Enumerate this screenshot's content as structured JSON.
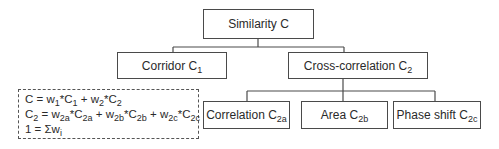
{
  "diagram": {
    "root": {
      "label": "Similarity C"
    },
    "level1": [
      {
        "label": "Corridor C",
        "sub": "1"
      },
      {
        "label": "Cross-correlation C",
        "sub": "2"
      }
    ],
    "level2": [
      {
        "label": "Correlation C",
        "sub": "2a"
      },
      {
        "label": "Area C",
        "sub": "2b"
      },
      {
        "label": "Phase shift C",
        "sub": "2c"
      }
    ],
    "formula": {
      "line1": {
        "a": "C = w",
        "s1": "1",
        "b": "*C",
        "s2": "1",
        "c": " + w",
        "s3": "2",
        "d": "*C",
        "s4": "2"
      },
      "line2": {
        "a": "C",
        "s1": "2",
        "b": " = w",
        "s2": "2a",
        "c": "*C",
        "s3": "2a",
        "d": " + w",
        "s4": "2b",
        "e": "*C",
        "s5": "2b",
        "f": " + w",
        "s6": "2c",
        "g": "*C",
        "s7": "2c"
      },
      "line3": {
        "a": "1 = Σw",
        "s1": "i"
      }
    }
  }
}
